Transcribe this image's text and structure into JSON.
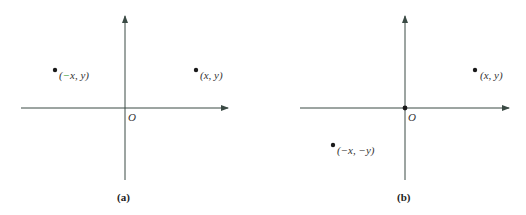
{
  "colors": {
    "axis": "#3a4a44",
    "point": "#1a1a1a",
    "text": "#333333",
    "highlight": "#2a9a2a"
  },
  "panels": [
    {
      "caption": "(a)",
      "origin_label": "O",
      "points": [
        {
          "label_prefix": "(",
          "label_neg": "−",
          "label_rest": "x, y)",
          "role": "reflected point"
        },
        {
          "label": "(x, y)",
          "role": "original point"
        }
      ]
    },
    {
      "caption": "(b)",
      "origin_label": "O",
      "points": [
        {
          "label": "(x, y)",
          "role": "original point"
        },
        {
          "label": "(−x, −y)",
          "role": "point reflected through origin"
        }
      ]
    }
  ]
}
